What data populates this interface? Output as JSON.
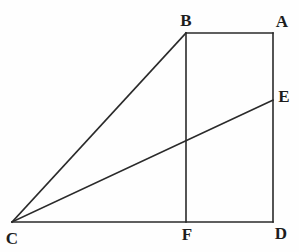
{
  "figure": {
    "background_color": "#fefefe",
    "stroke_color": "#2a2a2a",
    "label_color": "#1d1d1d",
    "stroke_width": 1.6,
    "canvas": {
      "width": 299,
      "height": 252
    }
  },
  "chart_data": {
    "type": "diagram",
    "title": "",
    "points": [
      {
        "id": "A",
        "label": "A",
        "x": 273,
        "y": 33,
        "label_x": 282,
        "label_y": 21
      },
      {
        "id": "B",
        "label": "B",
        "x": 186,
        "y": 33,
        "label_x": 186,
        "label_y": 20
      },
      {
        "id": "C",
        "label": "C",
        "x": 12,
        "y": 222,
        "label_x": 12,
        "label_y": 238
      },
      {
        "id": "D",
        "label": "D",
        "x": 273,
        "y": 222,
        "label_x": 281,
        "label_y": 233
      },
      {
        "id": "E",
        "label": "E",
        "x": 273,
        "y": 100,
        "label_x": 284,
        "label_y": 96
      },
      {
        "id": "F",
        "label": "F",
        "x": 186,
        "y": 222,
        "label_x": 187,
        "label_y": 234
      }
    ],
    "segments": [
      {
        "id": "BA",
        "from": "B",
        "to": "A",
        "x1": 186,
        "y1": 33,
        "x2": 273,
        "y2": 33
      },
      {
        "id": "AD",
        "from": "A",
        "to": "D",
        "x1": 273,
        "y1": 33,
        "x2": 273,
        "y2": 222
      },
      {
        "id": "CD",
        "from": "C",
        "to": "D",
        "x1": 12,
        "y1": 222,
        "x2": 273,
        "y2": 222
      },
      {
        "id": "BF",
        "from": "B",
        "to": "F",
        "x1": 186,
        "y1": 33,
        "x2": 186,
        "y2": 222
      },
      {
        "id": "CB",
        "from": "C",
        "to": "B",
        "x1": 12,
        "y1": 222,
        "x2": 186,
        "y2": 33
      },
      {
        "id": "CE",
        "from": "C",
        "to": "E",
        "x1": 12,
        "y1": 222,
        "x2": 273,
        "y2": 100
      }
    ]
  }
}
